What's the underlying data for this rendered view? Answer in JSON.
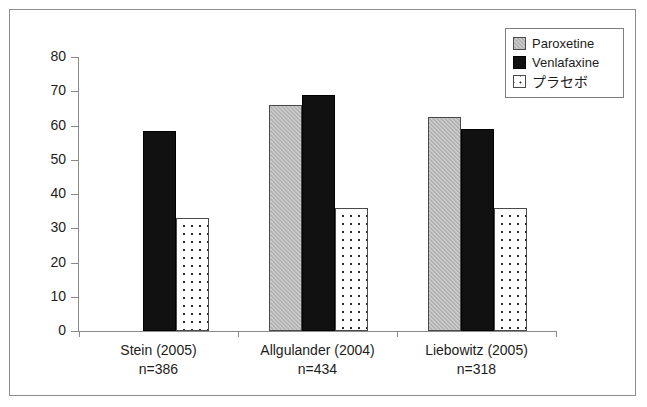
{
  "chart_data": {
    "type": "bar",
    "title": "",
    "subtitle": "",
    "xlabel": "",
    "ylabel": "",
    "ylim": [
      0,
      80
    ],
    "ytick_step": 10,
    "ytick_labels": [
      "0",
      "10",
      "20",
      "30",
      "40",
      "50",
      "60",
      "70",
      "80"
    ],
    "grid": false,
    "legend_position": "top-right",
    "categories": [
      "Stein (2005)",
      "Allgulander (2004)",
      "Liebowitz (2005)"
    ],
    "category_sublabels": [
      "n=386",
      "n=434",
      "n=318"
    ],
    "series": [
      {
        "name": "Paroxetine",
        "values": [
          null,
          66,
          62.5
        ]
      },
      {
        "name": "Venlafaxine",
        "values": [
          58.5,
          69,
          59
        ]
      },
      {
        "name": "プラセボ",
        "values": [
          33,
          36,
          36
        ]
      }
    ]
  },
  "legend": {
    "items": [
      {
        "label": "Paroxetine",
        "swatch": "gray-hatched-swatch"
      },
      {
        "label": "Venlafaxine",
        "swatch": "black-swatch"
      },
      {
        "label": "プラセボ",
        "swatch": "dotted-swatch"
      }
    ]
  },
  "colors": {
    "paroxetine": "#b3b3b3",
    "venlafaxine": "#111111",
    "placebo": "#ffffff",
    "axis": "#8a8a8a",
    "text": "#1c1c1c",
    "frame": "#8d8d8d"
  },
  "axis": {
    "y_ticks": [
      {
        "value": 80,
        "label": "80"
      },
      {
        "value": 70,
        "label": "70"
      },
      {
        "value": 60,
        "label": "60"
      },
      {
        "value": 50,
        "label": "50"
      },
      {
        "value": 40,
        "label": "40"
      },
      {
        "value": 30,
        "label": "30"
      },
      {
        "value": 20,
        "label": "20"
      },
      {
        "value": 10,
        "label": "10"
      },
      {
        "value": 0,
        "label": "0"
      }
    ]
  },
  "groups": [
    {
      "study_label": "Stein (2005)",
      "n_label": "n=386",
      "bars": [
        {
          "series": "Venlafaxine",
          "value": 58.5
        },
        {
          "series": "プラセボ",
          "value": 33
        }
      ]
    },
    {
      "study_label": "Allgulander (2004)",
      "n_label": "n=434",
      "bars": [
        {
          "series": "Paroxetine",
          "value": 66
        },
        {
          "series": "Venlafaxine",
          "value": 69
        },
        {
          "series": "プラセボ",
          "value": 36
        }
      ]
    },
    {
      "study_label": "Liebowitz (2005)",
      "n_label": "n=318",
      "bars": [
        {
          "series": "Paroxetine",
          "value": 62.5
        },
        {
          "series": "Venlafaxine",
          "value": 59
        },
        {
          "series": "プラセボ",
          "value": 36
        }
      ]
    }
  ]
}
